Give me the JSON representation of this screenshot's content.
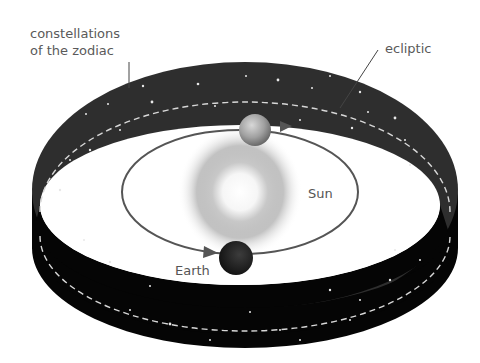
{
  "labels": {
    "zodiac_line1": "constellations",
    "zodiac_line2": "of the zodiac",
    "ecliptic": "ecliptic",
    "sun": "Sun",
    "earth": "Earth"
  },
  "colors": {
    "band_top": "#2e2e2e",
    "band_side": "#050505",
    "inner_floor": "#ffffff",
    "orbit": "#555555",
    "ecliptic_dash": "#d8d8d8",
    "sun_glow": "#9a9a9a",
    "sun_core": "#f4f4f4",
    "label_text": "#5a5a5a",
    "earth_dark": "#2a2a2a",
    "earth_light": "#b0b0b0"
  },
  "elements": {
    "ring": "zodiac constellation band (cylinder)",
    "ecliptic_line": "dashed line around band",
    "orbit": "Earth orbit ellipse with direction arrows",
    "sun": "central glowing Sun",
    "earth_positions": [
      "far side (lit)",
      "near side (dark)"
    ]
  }
}
